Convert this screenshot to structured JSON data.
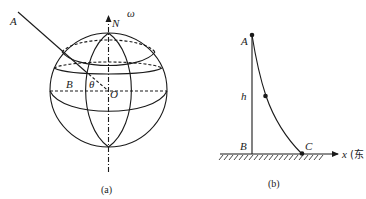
{
  "figure_a": {
    "caption": "(a)",
    "labels": {
      "A": "A",
      "N": "N",
      "omega": "ω",
      "B": "B",
      "theta": "θ",
      "O": "O"
    }
  },
  "figure_b": {
    "caption": "(b)",
    "labels": {
      "A": "A",
      "h": "h",
      "B": "B",
      "C": "C",
      "x_axis": "x",
      "x_axis_note": "(东"
    }
  },
  "colors": {
    "stroke": "#1a1a1a",
    "background": "#ffffff"
  }
}
